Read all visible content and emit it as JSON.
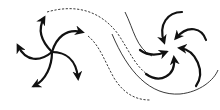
{
  "diagram": {
    "colors": {
      "stroke": "#111111",
      "background": "#ffffff"
    },
    "source": {
      "label": "",
      "center": [
        52,
        52
      ],
      "arrow_count": 5,
      "direction": "outward"
    },
    "sink": {
      "label": "",
      "center": [
        172,
        48
      ],
      "arrow_count": 5,
      "direction": "inward"
    },
    "connectors": {
      "dashed": 2,
      "solid": 2
    }
  }
}
